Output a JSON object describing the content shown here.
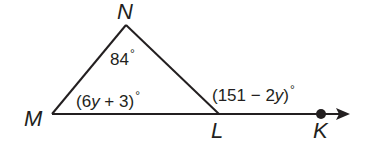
{
  "diagram": {
    "type": "triangle-exterior-angle",
    "points": {
      "N": {
        "label": "N"
      },
      "M": {
        "label": "M"
      },
      "L": {
        "label": "L"
      },
      "K": {
        "label": "K"
      }
    },
    "angles": {
      "N": {
        "text": "84",
        "degree": "°"
      },
      "M": {
        "pre": "(6",
        "var": "y",
        "post": " + 3)",
        "degree": "°"
      },
      "exterior_L": {
        "pre": "(151 − 2",
        "var": "y",
        "post": ")",
        "degree": "°"
      }
    },
    "colors": {
      "line": "#231f20",
      "background": "#ffffff"
    }
  }
}
